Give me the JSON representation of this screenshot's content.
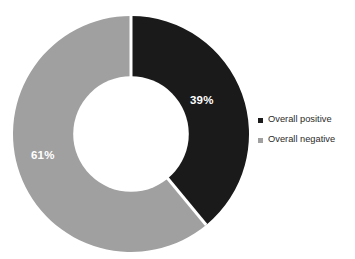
{
  "chart_data": {
    "type": "pie",
    "variant": "donut",
    "title": "",
    "subtitle": "",
    "xlabel": "",
    "ylabel": "",
    "grid": false,
    "legend_position": "right",
    "hole_ratio": 0.49,
    "start_angle_deg": 0,
    "direction": "clockwise",
    "unit": "%",
    "categories": [
      "Overall positive",
      "Overall negative"
    ],
    "values": [
      39,
      61
    ],
    "slices": [
      {
        "label": "Overall positive",
        "value": 39,
        "display": "39%",
        "color": "#1a1a1a",
        "label_color": "#ffffff"
      },
      {
        "label": "Overall negative",
        "value": 61,
        "display": "61%",
        "color": "#a0a0a0",
        "label_color": "#ffffff"
      }
    ],
    "legend": [
      {
        "label": "Overall positive",
        "color": "#1a1a1a",
        "marker": "square"
      },
      {
        "label": "Overall negative",
        "color": "#a0a0a0",
        "marker": "square"
      }
    ],
    "background_color": "#ffffff",
    "separator_color": "#ffffff"
  }
}
